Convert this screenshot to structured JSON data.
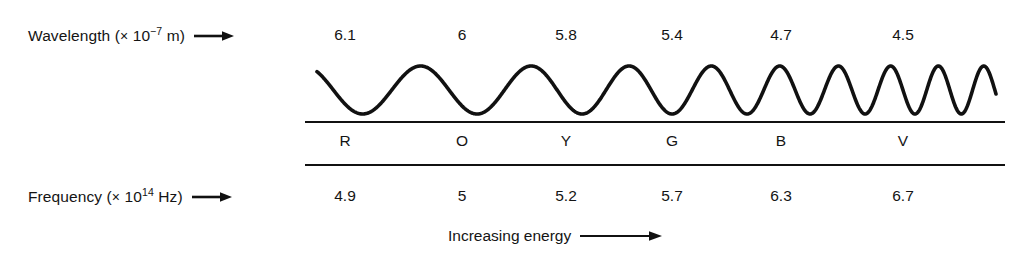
{
  "figure": {
    "background_color": "#ffffff",
    "ink_color": "#111111"
  },
  "wavelength_axis": {
    "label_prefix": "Wavelength (",
    "label_times": "×",
    "label_base": "10",
    "label_exponent": "−7",
    "label_unit": " m)",
    "arrow": "arrow-right-icon",
    "values": [
      "6.1",
      "6.0",
      "5.8",
      "5.4",
      "4.7",
      "4.5"
    ]
  },
  "frequency_axis": {
    "label_prefix": "Frequency (",
    "label_times": "×",
    "label_base": "10",
    "label_exponent": "14",
    "label_unit": " Hz)",
    "arrow": "arrow-right-icon",
    "values": [
      "4.9",
      "5.0",
      "5.2",
      "5.7",
      "6.3",
      "6.7"
    ]
  },
  "color_bands": {
    "letters": [
      "R",
      "O",
      "Y",
      "G",
      "B",
      "V"
    ],
    "names": [
      "Red",
      "Orange",
      "Yellow",
      "Green",
      "Blue",
      "Violet"
    ]
  },
  "caption": {
    "text": "Increasing energy",
    "arrow": "arrow-right-icon"
  },
  "chart_data": {
    "type": "line",
    "title": "",
    "xlabel": "Increasing energy",
    "ylabel": "",
    "categories": [
      "R",
      "O",
      "Y",
      "G",
      "B",
      "V"
    ],
    "series": [
      {
        "name": "Wavelength (× 10⁻⁷ m)",
        "values": [
          6.1,
          6.0,
          5.8,
          5.4,
          4.7,
          4.5
        ]
      },
      {
        "name": "Frequency (× 10¹⁴ Hz)",
        "values": [
          4.9,
          5.0,
          5.2,
          5.7,
          6.3,
          6.7
        ]
      }
    ],
    "annotations": [
      "Increasing energy"
    ],
    "grid": false,
    "legend": "none",
    "waveform": {
      "description": "Sinusoid whose wavelength shortens from left (red) to right (violet)",
      "x_start": 317,
      "x_end": 996,
      "baseline_y": 90,
      "amplitude": 24,
      "start_phase_deg": 130,
      "wavelengths_px": [
        118,
        116,
        112,
        104,
        92,
        78,
        64,
        54,
        47,
        44
      ],
      "stroke_width": 3.6
    }
  }
}
